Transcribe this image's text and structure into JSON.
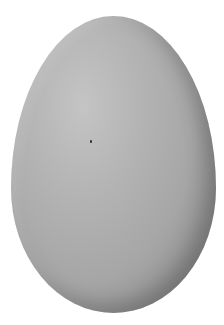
{
  "image": {
    "subject": "egg",
    "background_color": "#ffffff",
    "egg_color": "#b0b0b0",
    "shadow_color": "#7c7c7c"
  }
}
